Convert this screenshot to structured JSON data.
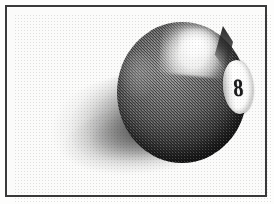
{
  "image": {
    "title": "Eight ball clip art",
    "subject": "billiard-8-ball",
    "style": "halftone-dithered-scan",
    "background_color": "#fdfdfc"
  },
  "frame": {
    "name": "border-frame",
    "color": "#3a3a3a",
    "thickness_px": 2,
    "inset_px": 5
  },
  "ball": {
    "name": "eight-ball",
    "number": "8",
    "body_color": "#3a3a3a",
    "shadow_color": "#4b4b4b",
    "highlight_color": "#ffffff",
    "disc_color": "#ffffff",
    "numeral_color": "#1b1b1b"
  },
  "shadow": {
    "name": "cast-shadow",
    "direction": "lower-left"
  }
}
